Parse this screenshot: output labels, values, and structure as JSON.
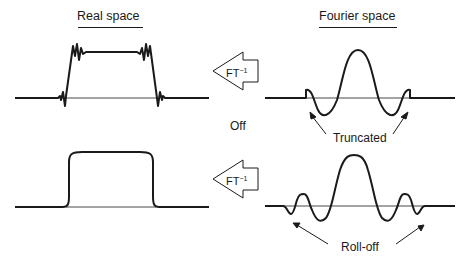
{
  "headers": {
    "left": "Real space",
    "right": "Fourier space"
  },
  "arrows": {
    "top": {
      "label": "FT",
      "superscript": "−1"
    },
    "bottom": {
      "label": "FT",
      "superscript": "−1"
    }
  },
  "labels": {
    "off": "Off",
    "truncated": "Truncated",
    "rolloff": "Roll-off"
  },
  "colors": {
    "ink": "#1a1a1a",
    "background": "#ffffff"
  }
}
